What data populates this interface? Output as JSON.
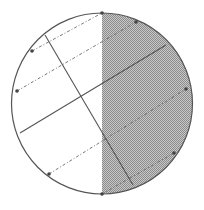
{
  "diagram": {
    "type": "circle-with-chords",
    "canvas": {
      "width": 204,
      "height": 210
    },
    "circle": {
      "cx": 102,
      "cy": 103.5,
      "r": 90.5,
      "stroke": "#555555"
    },
    "shaded_region": {
      "side": "right-half",
      "boundary_x": 102,
      "fill_light": "#c8c8c8",
      "fill_dark": "#8c8c8c"
    },
    "solid_lines": [
      {
        "id": "chord-steep",
        "x1": 45,
        "y1": 35,
        "x2": 133,
        "y2": 185
      },
      {
        "id": "chord-shallow",
        "x1": 20,
        "y1": 133,
        "x2": 166,
        "y2": 45
      }
    ],
    "dashed_lines": [
      {
        "id": "dash-1",
        "x1": 32,
        "y1": 51,
        "x2": 102,
        "y2": 13
      },
      {
        "id": "dash-2",
        "x1": 17,
        "y1": 91,
        "x2": 136,
        "y2": 22
      },
      {
        "id": "dash-3",
        "x1": 49,
        "y1": 174,
        "x2": 186,
        "y2": 89
      },
      {
        "id": "dash-4",
        "x1": 102,
        "y1": 194,
        "x2": 174,
        "y2": 153
      }
    ],
    "points": [
      {
        "id": "p-top",
        "x": 102,
        "y": 13
      },
      {
        "id": "p-top-right",
        "x": 136,
        "y": 22
      },
      {
        "id": "p-left-upper",
        "x": 32,
        "y": 51
      },
      {
        "id": "p-left",
        "x": 17,
        "y": 91
      },
      {
        "id": "p-right",
        "x": 186,
        "y": 89
      },
      {
        "id": "p-right-lower",
        "x": 174,
        "y": 153
      },
      {
        "id": "p-bottom-left",
        "x": 49,
        "y": 174
      },
      {
        "id": "p-bottom",
        "x": 102,
        "y": 194
      }
    ],
    "line_color": "#555555",
    "dash_color": "#666666",
    "point_color": "#444444"
  }
}
